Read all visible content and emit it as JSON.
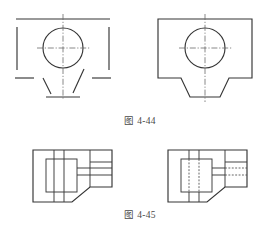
{
  "page": {
    "background_color": "#ffffff",
    "line_color": "#353535",
    "hidden_line_color": "#4a4a4a",
    "center_line_color": "#6a6a6a",
    "width": 280,
    "height": 225
  },
  "figures": [
    {
      "id": "fig-4-44",
      "caption": "图 4-44",
      "views": [
        {
          "id": "fig-4-44-left",
          "role": "incomplete-view",
          "description": "Front view with missing (broken) outline segments to be completed by the student",
          "features": [
            "top-edge-line",
            "left-vertical-segment",
            "right-vertical-segment",
            "circle",
            "center-lines",
            "lower-left-step-segment",
            "lower-right-step-segment",
            "left-slanted-segment",
            "right-slanted-segment",
            "bottom-edge-segment"
          ]
        },
        {
          "id": "fig-4-44-right",
          "role": "complete-view",
          "description": "Front view of a block with a trapezoidal notch cut in the bottom face and a through hole in the centre",
          "features": [
            "rectangular-outline",
            "trapezoidal-bottom-notch",
            "circle",
            "vertical-center-line",
            "horizontal-center-line"
          ]
        }
      ]
    },
    {
      "id": "fig-4-45",
      "caption": "图 4-45",
      "views": [
        {
          "id": "fig-4-45-left",
          "role": "visible-only-view",
          "description": "Top view of a stepped block drawn with visible outlines only",
          "features": [
            "outer-outline",
            "chamfered-lower-right-corner",
            "inner-rectangle-boss",
            "two-vertical-rib-lines",
            "two-horizontal-step-lines",
            "upper-step-lines"
          ]
        },
        {
          "id": "fig-4-45-right",
          "role": "with-hidden-lines-view",
          "description": "Same top view including hidden (dashed) lines for the internal slot and the right-hand recess",
          "features": [
            "outer-outline",
            "chamfered-lower-right-corner",
            "inner-rectangle-boss",
            "two-vertical-hidden-lines",
            "two-horizontal-step-lines",
            "two-horizontal-hidden-lines-right",
            "upper-step-lines"
          ]
        }
      ]
    }
  ],
  "captions": {
    "fig_4_44": "图 4-44",
    "fig_4_45": "图 4-45"
  }
}
